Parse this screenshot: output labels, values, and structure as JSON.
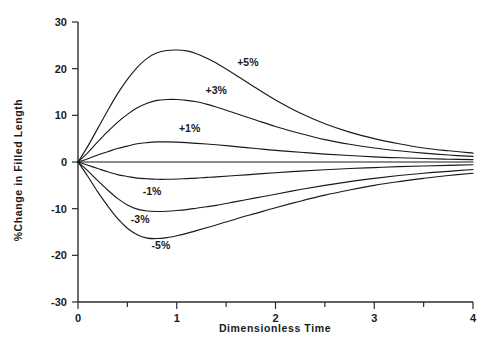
{
  "chart_data": {
    "type": "line",
    "title": "",
    "subtitle": "",
    "xlabel": "Dimensionless Time",
    "ylabel": "%Change in Filled Length",
    "xlim": [
      0,
      4
    ],
    "ylim": [
      -30,
      30
    ],
    "xticks": [
      0,
      1,
      2,
      3,
      4
    ],
    "xticklabels": [
      "0",
      "1",
      "2",
      "3",
      "4"
    ],
    "xminorticks": [
      0.5,
      1.5,
      2.5,
      3.5
    ],
    "yticks": [
      30,
      20,
      10,
      0,
      -10,
      -20,
      -30
    ],
    "yticklabels": [
      "30",
      "20",
      "10",
      "0",
      "-10",
      "-20",
      "-30"
    ],
    "grid": false,
    "legend_position": "inline-annotations",
    "x": [
      0,
      0.1,
      0.2,
      0.3,
      0.4,
      0.5,
      0.6,
      0.7,
      0.8,
      0.9,
      1.0,
      1.1,
      1.2,
      1.3,
      1.4,
      1.6,
      1.8,
      2.0,
      2.25,
      2.5,
      2.75,
      3.0,
      3.25,
      3.5,
      3.75,
      4.0
    ],
    "series": [
      {
        "name": "+5%",
        "label": "+5%",
        "label_x": 1.72,
        "label_y": 21.5,
        "peak_x": 1.03,
        "peak_y": 24.0,
        "values": [
          0,
          3.4,
          7.2,
          11.0,
          14.6,
          17.7,
          20.3,
          22.2,
          23.4,
          23.9,
          24.0,
          23.8,
          23.2,
          22.3,
          21.2,
          18.6,
          15.9,
          13.3,
          10.5,
          8.2,
          6.4,
          5.0,
          3.9,
          3.0,
          2.4,
          1.9
        ]
      },
      {
        "name": "+3%",
        "label": "+3%",
        "label_x": 1.4,
        "label_y": 15.4,
        "peak_x": 1.02,
        "peak_y": 13.4,
        "values": [
          0,
          2.0,
          4.3,
          6.5,
          8.5,
          10.2,
          11.6,
          12.6,
          13.2,
          13.4,
          13.4,
          13.2,
          12.9,
          12.4,
          11.8,
          10.4,
          9.0,
          7.6,
          6.1,
          4.8,
          3.8,
          3.0,
          2.4,
          1.9,
          1.5,
          1.2
        ]
      },
      {
        "name": "+1%",
        "label": "+1%",
        "label_x": 1.13,
        "label_y": 7.2,
        "peak_x": 0.95,
        "peak_y": 4.3,
        "values": [
          0,
          0.7,
          1.5,
          2.2,
          2.9,
          3.4,
          3.9,
          4.15,
          4.3,
          4.3,
          4.25,
          4.15,
          4.0,
          3.85,
          3.7,
          3.3,
          2.9,
          2.5,
          2.1,
          1.7,
          1.4,
          1.1,
          0.9,
          0.75,
          0.6,
          0.5
        ]
      },
      {
        "name": "0%",
        "label": "",
        "label_x": null,
        "label_y": null,
        "peak_x": 0,
        "peak_y": 0,
        "values": [
          0,
          0,
          0,
          0,
          0,
          0,
          0,
          0,
          0,
          0,
          0,
          0,
          0,
          0,
          0,
          0,
          0,
          0,
          0,
          0,
          0,
          0,
          0,
          0,
          0,
          0
        ]
      },
      {
        "name": "-1%",
        "label": "-1%",
        "label_x": 0.75,
        "label_y": -6.2,
        "peak_x": 0.85,
        "peak_y": -3.7,
        "values": [
          0,
          -0.7,
          -1.4,
          -2.1,
          -2.7,
          -3.1,
          -3.45,
          -3.6,
          -3.7,
          -3.7,
          -3.65,
          -3.55,
          -3.45,
          -3.3,
          -3.2,
          -2.9,
          -2.6,
          -2.3,
          -1.95,
          -1.65,
          -1.4,
          -1.2,
          -1.0,
          -0.85,
          -0.72,
          -0.6
        ]
      },
      {
        "name": "-3%",
        "label": "-3%",
        "label_x": 0.63,
        "label_y": -12.2,
        "peak_x": 0.82,
        "peak_y": -10.6,
        "values": [
          0,
          -1.9,
          -4.0,
          -6.0,
          -7.8,
          -9.2,
          -10.1,
          -10.5,
          -10.6,
          -10.55,
          -10.4,
          -10.2,
          -9.9,
          -9.6,
          -9.3,
          -8.5,
          -7.7,
          -6.9,
          -5.9,
          -5.0,
          -4.2,
          -3.5,
          -2.9,
          -2.4,
          -2.0,
          -1.6
        ]
      },
      {
        "name": "-5%",
        "label": "-5%",
        "label_x": 0.84,
        "label_y": -17.8,
        "peak_x": 0.76,
        "peak_y": -16.4,
        "values": [
          0,
          -3.1,
          -6.4,
          -9.4,
          -12.1,
          -14.2,
          -15.6,
          -16.3,
          -16.4,
          -16.2,
          -15.8,
          -15.3,
          -14.7,
          -14.1,
          -13.5,
          -12.2,
          -11.0,
          -9.8,
          -8.4,
          -7.1,
          -6.0,
          -5.0,
          -4.2,
          -3.5,
          -2.9,
          -2.4
        ]
      }
    ]
  },
  "figure": {
    "background_color": "#ffffff",
    "line_color": "#1a1a1a",
    "axis_color": "#2b2b2b"
  }
}
